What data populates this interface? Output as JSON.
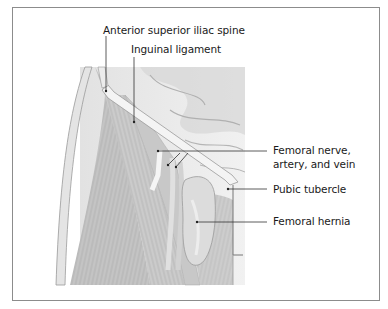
{
  "figure": {
    "type": "anatomical illustration",
    "labels": [
      {
        "id": "asis",
        "text": "Anterior superior iliac spine"
      },
      {
        "id": "inguinal",
        "text": "Inguinal ligament"
      },
      {
        "id": "femoral_nva_1",
        "text": "Femoral nerve,"
      },
      {
        "id": "femoral_nva_2",
        "text": "artery, and vein"
      },
      {
        "id": "pubic",
        "text": "Pubic tubercle"
      },
      {
        "id": "hernia",
        "text": "Femoral hernia"
      }
    ]
  },
  "colors": {
    "border": "#8c8c8c",
    "leader": "#333333",
    "tissue_bg": "#e9e9e9",
    "muscle": "#bdbdbd",
    "muscle_dark": "#9e9e9e",
    "ligament": "#f2f2f2"
  }
}
